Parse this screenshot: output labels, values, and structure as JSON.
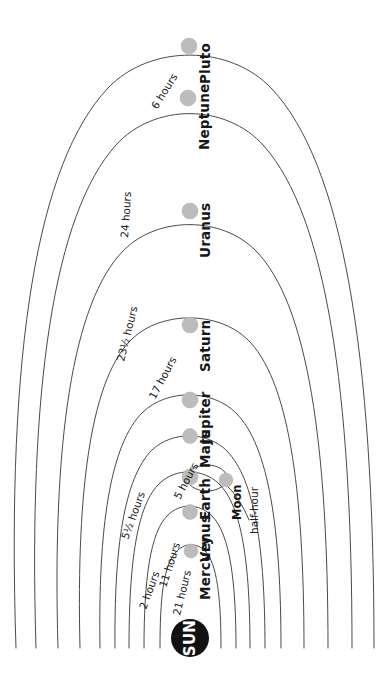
{
  "diagram": {
    "orientation": "rotated-90-ccw",
    "center_label": "SUN",
    "center_color": "#111111",
    "planet_dot_color": "#bcbcbc",
    "orbit_line_color": "#4a4a4a",
    "background_color": "#ffffff"
  },
  "bodies": [
    {
      "name": "Mercury",
      "rotation_label": "21 hours",
      "rotation_value": "21",
      "rotation_unit": "hours"
    },
    {
      "name": "Venus",
      "rotation_label": "11 hours",
      "rotation_value": "11",
      "rotation_unit": "hours"
    },
    {
      "name": "Earth",
      "rotation_label": "2 hours",
      "rotation_value": "2",
      "rotation_unit": "hours"
    },
    {
      "name": "Mars",
      "rotation_label": "5 hours",
      "rotation_value": "5",
      "rotation_unit": "hours"
    },
    {
      "name": "Jupiter",
      "rotation_label": "5½ hours",
      "rotation_value": "5½",
      "rotation_unit": "hours"
    },
    {
      "name": "Saturn",
      "rotation_label": "17 hours",
      "rotation_value": "17",
      "rotation_unit": "hours"
    },
    {
      "name": "Uranus",
      "rotation_label": "23½ hours",
      "rotation_value": "23½",
      "rotation_unit": "hours"
    },
    {
      "name": "Neptune",
      "rotation_label": "24 hours",
      "rotation_value": "24",
      "rotation_unit": "hours"
    },
    {
      "name": "Pluto",
      "rotation_label": "6 hours",
      "rotation_value": "6",
      "rotation_unit": "hours"
    }
  ],
  "moon": {
    "name": "Moon",
    "rotation_label": "half-hour"
  },
  "labels": {
    "sun": "SUN",
    "mercury": "Mercury",
    "venus": "Venus",
    "earth": "Earth",
    "mars": "Mars",
    "jupiter": "Jupiter",
    "saturn": "Saturn",
    "uranus": "Uranus",
    "neptune": "Neptune",
    "pluto": "Pluto",
    "moon": "Moon",
    "t_21_hours": "21 hours",
    "t_2_hours": "2 hours",
    "t_11_hours": "11 hours",
    "t_5_hours": "5 hours",
    "t_5half_hours": "5½ hours",
    "t_17_hours": "17 hours",
    "t_23half_hours": "23½ hours",
    "t_24_hours": "24 hours",
    "t_6_hours": "6 hours",
    "t_half_hour": "half-hour"
  }
}
